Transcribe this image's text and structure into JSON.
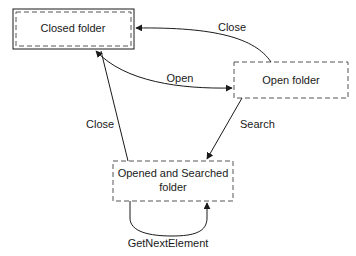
{
  "diagram": {
    "type": "state-diagram",
    "nodes": [
      {
        "id": "closed",
        "label_lines": [
          "Closed folder"
        ],
        "style": "double-border"
      },
      {
        "id": "open",
        "label_lines": [
          "Open folder"
        ],
        "style": "dashed"
      },
      {
        "id": "searched",
        "label_lines": [
          "Opened and Searched",
          "folder"
        ],
        "style": "dashed"
      }
    ],
    "edges": [
      {
        "from": "open",
        "to": "closed",
        "label": "Close"
      },
      {
        "from": "closed",
        "to": "open",
        "label": "Open"
      },
      {
        "from": "open",
        "to": "searched",
        "label": "Search"
      },
      {
        "from": "searched",
        "to": "closed",
        "label": "Close"
      },
      {
        "from": "searched",
        "to": "searched",
        "label": "GetNextElement"
      }
    ]
  },
  "colors": {
    "stroke": "#1a1a1a",
    "dash": "#555555",
    "background": "#ffffff"
  }
}
